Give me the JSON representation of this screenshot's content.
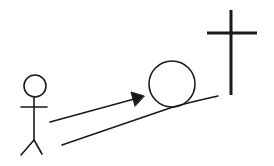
{
  "diagram": {
    "type": "line-drawing",
    "elements": [
      {
        "id": "stick-figure",
        "label": "person"
      },
      {
        "id": "arrow",
        "label": "direction of push"
      },
      {
        "id": "boulder",
        "label": "circle / boulder"
      },
      {
        "id": "slope",
        "label": "uphill slope"
      },
      {
        "id": "cross",
        "label": "cross"
      }
    ],
    "colors": {
      "background": "#ffffff",
      "stroke": "#1a1a1a"
    }
  }
}
